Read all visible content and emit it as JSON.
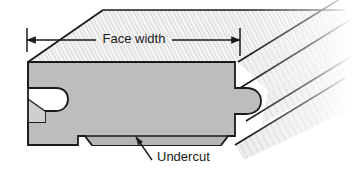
{
  "figure": {
    "name": "flooring-board-cross-section",
    "background_color": "#ffffff"
  },
  "annotations": {
    "face_width": {
      "label": "Face width",
      "type": "dimension",
      "arrow_left": "arrow-left",
      "arrow_right": "arrow-right"
    },
    "undercut": {
      "label": "Undercut",
      "type": "leader-callout",
      "arrow": "arrow-up-left"
    }
  },
  "geometry": {
    "front_face_color": "#bdbdbd",
    "top_face_color": "#f2f2f2",
    "grain_color": "#b5b5b5",
    "outline_color": "#1a1a1a",
    "side_face_color": "#e8e8e8"
  },
  "parts": {
    "front_face": "front-cross-section-face",
    "groove": "groove-left-edge",
    "tongue": "tongue-right-edge",
    "undercut_recess": "undercut-bottom-recess",
    "top_surface": "top-face-with-grain",
    "fade_edge": "torn-fade-right-edge"
  }
}
